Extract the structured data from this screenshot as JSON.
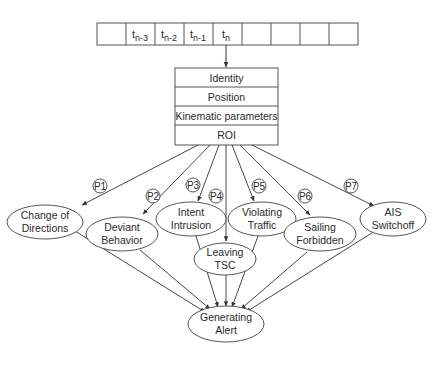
{
  "timeline": {
    "cells": [
      "",
      "t_n-3",
      "t_n-2",
      "t_n-1",
      "t_n",
      "",
      "",
      "",
      ""
    ],
    "labels": [
      {
        "base": "t",
        "sub": "n-3"
      },
      {
        "base": "t",
        "sub": "n-2"
      },
      {
        "base": "t",
        "sub": "n-1"
      },
      {
        "base": "t",
        "sub": "n"
      }
    ]
  },
  "record": {
    "fields": [
      "Identity",
      "Position",
      "Kinematic parameters",
      "ROI"
    ]
  },
  "paths": [
    "P1",
    "P2",
    "P3",
    "P4",
    "P5",
    "P6",
    "P7"
  ],
  "behaviors": [
    {
      "id": "change-of-directions",
      "line1": "Change of",
      "line2": "Directions",
      "path": "P1"
    },
    {
      "id": "deviant-behavior",
      "line1": "Deviant",
      "line2": "Behavior",
      "path": "P2"
    },
    {
      "id": "intent-intrusion",
      "line1": "Intent",
      "line2": "Intrusion",
      "path": "P3"
    },
    {
      "id": "leaving-tsc",
      "line1": "Leaving",
      "line2": "TSC",
      "path": "P4"
    },
    {
      "id": "violating-traffic",
      "line1": "Violating",
      "line2": "Traffic",
      "path": "P5"
    },
    {
      "id": "sailing-forbidden",
      "line1": "Sailing",
      "line2": "Forbidden",
      "path": "P6"
    },
    {
      "id": "ais-switchoff",
      "line1": "AIS",
      "line2": "Switchoff",
      "path": "P7"
    }
  ],
  "output": {
    "line1": "Generating",
    "line2": "Alert"
  },
  "colors": {
    "stroke": "#555555",
    "text": "#2a2a2a",
    "background": "#ffffff"
  }
}
